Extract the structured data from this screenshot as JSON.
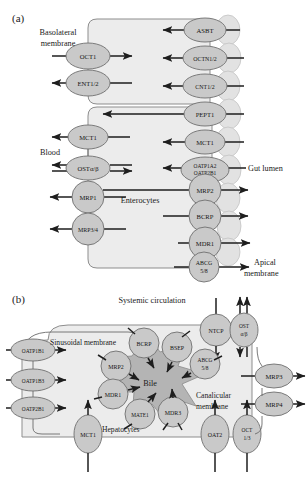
{
  "figure": {
    "panels": [
      {
        "id": "a",
        "label": "(a)",
        "title_cell": "Enterocytes",
        "annotations": {
          "basolateral": "Basolateral\nmembrane",
          "basolateral_l1": "Basolateral",
          "basolateral_l2": "membrane",
          "blood": "Blood",
          "cell_label": "Enterocytes",
          "gut_lumen": "Gut lumen",
          "apical_l1": "Apical",
          "apical_l2": "membrane"
        },
        "basolateral_transporters": [
          {
            "name": "OCT1",
            "direction": "into-cell-and-out",
            "arrows": "in-right"
          },
          {
            "name": "ENT1/2",
            "direction": "bidirectional",
            "arrows": "out-left"
          },
          {
            "name": "MCT1",
            "direction": "efflux",
            "arrows": "out-left"
          },
          {
            "name": "OSTα/β",
            "direction": "bidirectional",
            "arrows": "both"
          },
          {
            "name": "MRP1",
            "direction": "efflux",
            "arrows": "out-left"
          },
          {
            "name": "MRP3/4",
            "direction": "efflux",
            "arrows": "out-left"
          }
        ],
        "apical_transporters": [
          {
            "name": "ASBT",
            "direction": "uptake",
            "arrows": "in-left"
          },
          {
            "name": "OCTN1/2",
            "direction": "uptake",
            "arrows": "in-left"
          },
          {
            "name": "CNT1/2",
            "direction": "uptake",
            "arrows": "in-left"
          },
          {
            "name": "PEPT1",
            "direction": "uptake",
            "arrows": "in-left"
          },
          {
            "name": "MCT1",
            "direction": "uptake",
            "arrows": "in-left"
          },
          {
            "name": "OATP1A2\nOATP2B1",
            "line1": "OATP1A2",
            "line2": "OATP2B1",
            "direction": "uptake",
            "arrows": "in-left"
          },
          {
            "name": "MRP2",
            "direction": "efflux",
            "arrows": "out-right"
          },
          {
            "name": "BCRP",
            "direction": "efflux",
            "arrows": "out-right"
          },
          {
            "name": "MDR1",
            "direction": "efflux",
            "arrows": "out-right"
          },
          {
            "name": "ABCG\n5/8",
            "line1": "ABCG",
            "line2": "5/8",
            "direction": "efflux",
            "arrows": "out-right"
          }
        ]
      },
      {
        "id": "b",
        "label": "(b)",
        "annotations": {
          "systemic": "Systemic circulation",
          "sinusoidal": "Sinusoidal membrane",
          "bile": "Bile",
          "canalicular_l1": "Canalicular",
          "canalicular_l2": "membrane",
          "hepatocytes": "Hepatocytes"
        },
        "sinusoidal_uptake": [
          {
            "name": "OATP1B1"
          },
          {
            "name": "OATP1B3"
          },
          {
            "name": "OATP2B1"
          },
          {
            "name": "MCT1"
          },
          {
            "name": "OAT2"
          },
          {
            "name": "OCT\n1/3",
            "line1": "OCT",
            "line2": "1/3"
          },
          {
            "name": "NTCP"
          },
          {
            "name": "OST\nα/β",
            "line1": "OST",
            "line2": "α/β"
          }
        ],
        "sinusoidal_efflux": [
          {
            "name": "MRP3"
          },
          {
            "name": "MRP4"
          }
        ],
        "canalicular_transporters": [
          {
            "name": "BCRP"
          },
          {
            "name": "BSEP"
          },
          {
            "name": "ABCG\n5/8",
            "line1": "ABCG",
            "line2": "5/8"
          },
          {
            "name": "MRP2"
          },
          {
            "name": "MDR1"
          },
          {
            "name": "MATE1"
          },
          {
            "name": "MDR3"
          }
        ]
      }
    ],
    "colors": {
      "node_fill": "#c9c9c9",
      "node_stroke": "#6f6f6f",
      "cell_fill": "#ececec",
      "cell_stroke": "#8d8d8d",
      "bile_fill": "#b4b4b4",
      "arrow": "#1e1e1e",
      "text": "#1a1a1a",
      "background": "#ffffff"
    }
  }
}
